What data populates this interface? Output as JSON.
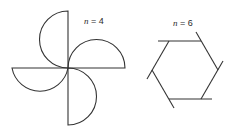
{
  "figures": [
    {
      "id": "pinwheel",
      "label_var": "n",
      "label_eq": " = 4",
      "n": 4,
      "description": "four semicircular blades arranged as a pinwheel"
    },
    {
      "id": "hexagon",
      "label_var": "n",
      "label_eq": " = 6",
      "n": 6,
      "description": "regular hexagon with each side extended past one vertex"
    }
  ],
  "colors": {
    "stroke": "#333333",
    "background": "#ffffff"
  }
}
